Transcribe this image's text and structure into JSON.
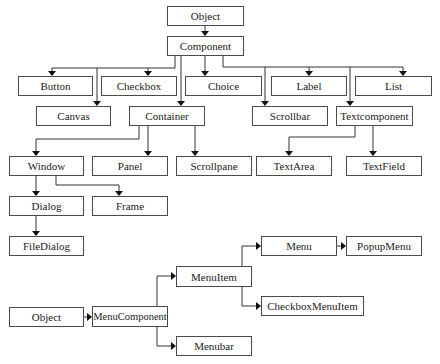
{
  "diagram": {
    "title": "",
    "colors": {
      "box_border": "#4a4a4a",
      "edge": "#333333",
      "text": "#222222",
      "background": "#ffffff"
    },
    "hierarchy_1": {
      "object": "Object",
      "component": "Component",
      "level_2a": [
        "Button",
        "Checkbox",
        "Choice",
        "Label",
        "List"
      ],
      "level_2b": [
        "Canvas",
        "Container",
        "Scrollbar",
        "Textcomponent"
      ],
      "container_children": [
        "Window",
        "Panel",
        "Scrollpane"
      ],
      "textcomponent_children": [
        "TextArea",
        "TextField"
      ],
      "window_children": [
        "Dialog",
        "Frame"
      ],
      "dialog_children": [
        "FileDialog"
      ]
    },
    "hierarchy_2": {
      "object": "Object",
      "menucomponent": "MenuComponent",
      "menuitem": "MenuItem",
      "menubar": "Menubar",
      "menu": "Menu",
      "popupmenu": "PopupMenu",
      "checkboxmenuitem": "CheckboxMenuItem"
    },
    "edges": [
      [
        "Object",
        "Component"
      ],
      [
        "Component",
        "Button"
      ],
      [
        "Component",
        "Checkbox"
      ],
      [
        "Component",
        "Choice"
      ],
      [
        "Component",
        "Label"
      ],
      [
        "Component",
        "List"
      ],
      [
        "Component",
        "Canvas"
      ],
      [
        "Component",
        "Container"
      ],
      [
        "Component",
        "Scrollbar"
      ],
      [
        "Component",
        "Textcomponent"
      ],
      [
        "Container",
        "Window"
      ],
      [
        "Container",
        "Panel"
      ],
      [
        "Container",
        "Scrollpane"
      ],
      [
        "Textcomponent",
        "TextArea"
      ],
      [
        "Textcomponent",
        "TextField"
      ],
      [
        "Window",
        "Dialog"
      ],
      [
        "Window",
        "Frame"
      ],
      [
        "Dialog",
        "FileDialog"
      ],
      [
        "Object",
        "MenuComponent"
      ],
      [
        "MenuComponent",
        "MenuItem"
      ],
      [
        "MenuComponent",
        "Menubar"
      ],
      [
        "MenuItem",
        "Menu"
      ],
      [
        "MenuItem",
        "CheckboxMenuItem"
      ],
      [
        "Menu",
        "PopupMenu"
      ]
    ]
  }
}
